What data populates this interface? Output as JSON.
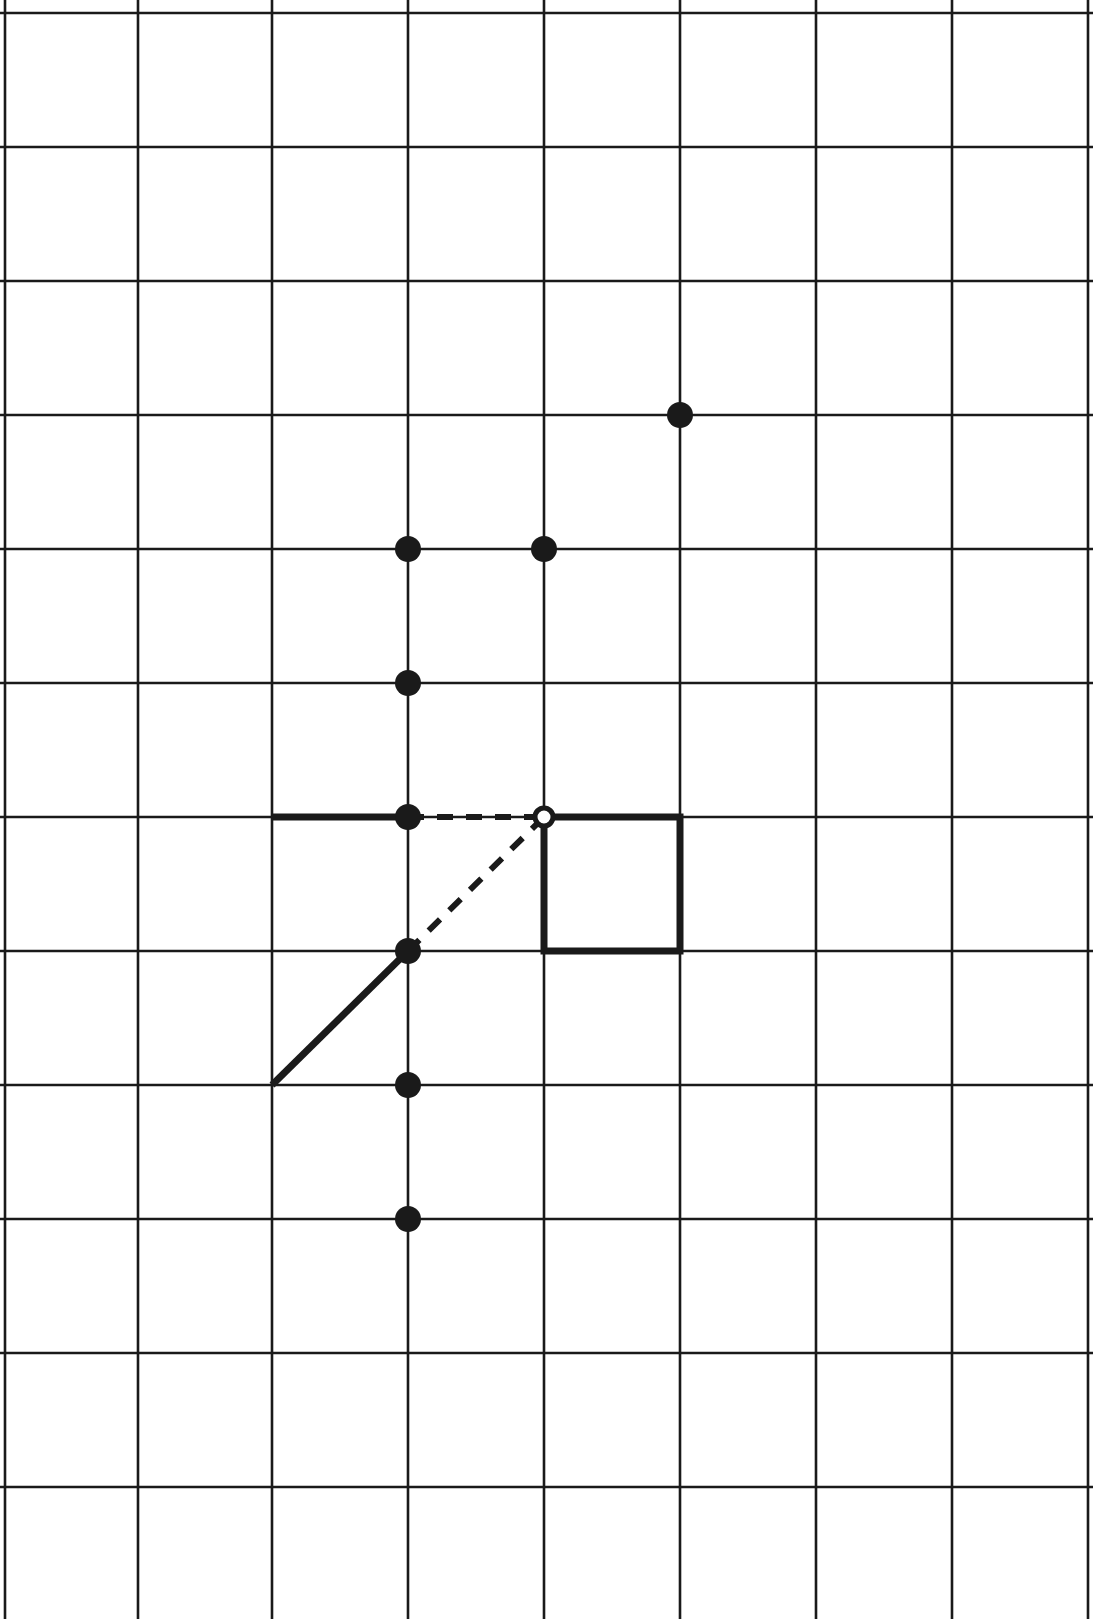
{
  "figure": {
    "width": 1093,
    "height": 1619,
    "background_color": "#ffffff",
    "ink_color": "#1a1a1a"
  },
  "grid": {
    "label": "square-lattice",
    "x_lines": [
      5,
      138,
      272,
      408,
      544,
      680,
      816,
      952,
      1088
    ],
    "y_lines": [
      13,
      147,
      281,
      415,
      549,
      683,
      817,
      951,
      1085,
      1219,
      1353,
      1487,
      1621
    ],
    "cell_size": 134,
    "columns": 8,
    "rows": 12,
    "line_color": "#1a1a1a",
    "line_width": 2.6,
    "grid_on": true
  },
  "points": {
    "filled_label": "filled-lattice-point",
    "open_label": "open-lattice-point",
    "filled_radius": 13,
    "open_radius": 13,
    "open_inner_radius": 9,
    "filled_color": "#1a1a1a",
    "open_fill_color": "#ffffff",
    "filled": [
      {
        "name": "point-a",
        "x": 680,
        "y": 415
      },
      {
        "name": "point-b",
        "x": 408,
        "y": 549
      },
      {
        "name": "point-c",
        "x": 544,
        "y": 549
      },
      {
        "name": "point-d",
        "x": 408,
        "y": 683
      },
      {
        "name": "point-e",
        "x": 408,
        "y": 817
      },
      {
        "name": "point-f",
        "x": 408,
        "y": 951
      },
      {
        "name": "point-g",
        "x": 408,
        "y": 1085
      },
      {
        "name": "point-h",
        "x": 408,
        "y": 1219
      }
    ],
    "open": [
      {
        "name": "point-vertex",
        "x": 544,
        "y": 817
      }
    ]
  },
  "bold_strokes": {
    "label": "bold-construction-lines",
    "color": "#1a1a1a",
    "width": 7,
    "segments": [
      {
        "name": "bold-horizontal-left",
        "x1": 272,
        "y1": 817,
        "x2": 408,
        "y2": 817
      },
      {
        "name": "bold-diagonal-lower-left",
        "x1": 272,
        "y1": 1085,
        "x2": 408,
        "y2": 951
      }
    ]
  },
  "bold_square": {
    "label": "bold-unit-square",
    "x": 544,
    "y": 817,
    "width": 136,
    "height": 134,
    "color": "#1a1a1a",
    "stroke_width": 7,
    "fill": "none"
  },
  "dashed_strokes": {
    "label": "dashed-construction-lines",
    "color": "#1a1a1a",
    "width": 6,
    "dash_pattern": "16 13",
    "segments": [
      {
        "name": "dashed-horizontal",
        "x1": 408,
        "y1": 817,
        "x2": 544,
        "y2": 817
      },
      {
        "name": "dashed-diagonal",
        "x1": 408,
        "y1": 951,
        "x2": 544,
        "y2": 817
      }
    ]
  },
  "chart_data": {
    "type": "scatter",
    "xlabel": "",
    "ylabel": "",
    "xlim": [
      0,
      8
    ],
    "ylim": [
      0,
      12
    ],
    "grid": true,
    "legend": "none",
    "note": "Coordinates given in lattice units measured from the top-left grid corner; x increases right, y increases down.",
    "series": [
      {
        "name": "filled points",
        "marker": "filled-circle",
        "x": [
          5,
          3,
          4,
          3,
          3,
          3,
          3,
          3
        ],
        "y": [
          3,
          4,
          4,
          5,
          6,
          7,
          8,
          9
        ]
      },
      {
        "name": "open point",
        "marker": "open-circle",
        "x": [
          4
        ],
        "y": [
          6
        ]
      }
    ],
    "annotations": [
      {
        "name": "bold-horizontal-left",
        "type": "segment",
        "style": "solid-bold",
        "from": [
          2,
          6
        ],
        "to": [
          3,
          6
        ]
      },
      {
        "name": "bold-diagonal-lower-left",
        "type": "segment",
        "style": "solid-bold",
        "from": [
          2,
          8
        ],
        "to": [
          3,
          7
        ]
      },
      {
        "name": "bold-unit-square",
        "type": "rect",
        "style": "solid-bold",
        "from": [
          4,
          6
        ],
        "to": [
          5,
          7
        ]
      },
      {
        "name": "dashed-horizontal",
        "type": "segment",
        "style": "dashed",
        "from": [
          3,
          6
        ],
        "to": [
          4,
          6
        ]
      },
      {
        "name": "dashed-diagonal",
        "type": "segment",
        "style": "dashed",
        "from": [
          3,
          7
        ],
        "to": [
          4,
          6
        ]
      }
    ]
  }
}
